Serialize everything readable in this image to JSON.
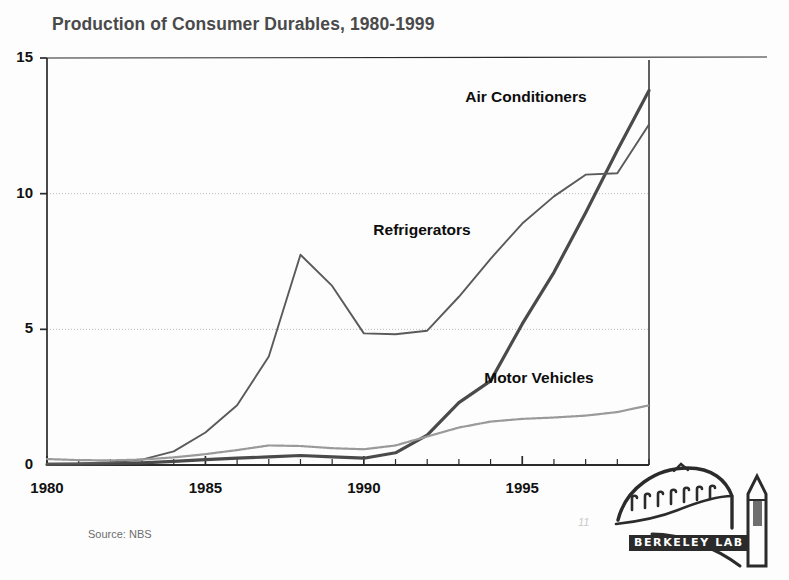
{
  "slide": {
    "title": "Production of Consumer Durables, 1980-1999",
    "source_note": "Source: NBS",
    "page_marker": "11"
  },
  "logo": {
    "wordmark": "BERKELEY LAB",
    "name": "berkeley-lab-logo"
  },
  "chart_data": {
    "type": "line",
    "title": "Production of Consumer Durables, 1980-1999",
    "xlabel": "",
    "ylabel": "",
    "xlim": [
      1980,
      1999
    ],
    "ylim": [
      0,
      15
    ],
    "ytick_labels": [
      "0",
      "5",
      "10",
      "15"
    ],
    "yticks": [
      0,
      5,
      10,
      15
    ],
    "xtick_labels": [
      "1980",
      "1985",
      "1990",
      "1995"
    ],
    "xticks": [
      1980,
      1985,
      1990,
      1995
    ],
    "grid": "horizontal-dotted-at-5-and-10",
    "legend": "inline-annotations",
    "x": [
      1980,
      1981,
      1982,
      1983,
      1984,
      1985,
      1986,
      1987,
      1988,
      1989,
      1990,
      1991,
      1992,
      1993,
      1994,
      1995,
      1996,
      1997,
      1998,
      1999
    ],
    "series": [
      {
        "name": "Air Conditioners",
        "style": "solid-dark-thick",
        "color": "#4a4a4a",
        "label_x": 1993.2,
        "label_y": 13.5,
        "values": [
          0.02,
          0.03,
          0.05,
          0.08,
          0.13,
          0.2,
          0.25,
          0.3,
          0.35,
          0.3,
          0.25,
          0.45,
          1.1,
          2.3,
          3.1,
          5.2,
          7.1,
          9.3,
          11.6,
          13.8
        ]
      },
      {
        "name": "Refrigerators",
        "style": "solid-medium",
        "color": "#5a5a5a",
        "label_x": 1990.3,
        "label_y": 8.6,
        "values": [
          0.05,
          0.06,
          0.1,
          0.2,
          0.5,
          1.2,
          2.2,
          4.0,
          7.75,
          6.6,
          4.85,
          4.82,
          4.95,
          6.2,
          7.6,
          8.9,
          9.9,
          10.7,
          10.75,
          12.55
        ]
      },
      {
        "name": "Motor Vehicles",
        "style": "dotted-light",
        "color": "#9a9a9a",
        "label_x": 1993.8,
        "label_y": 3.15,
        "values": [
          0.22,
          0.18,
          0.17,
          0.2,
          0.28,
          0.4,
          0.55,
          0.72,
          0.7,
          0.62,
          0.58,
          0.72,
          1.05,
          1.38,
          1.6,
          1.7,
          1.75,
          1.82,
          1.95,
          2.2
        ]
      }
    ]
  }
}
